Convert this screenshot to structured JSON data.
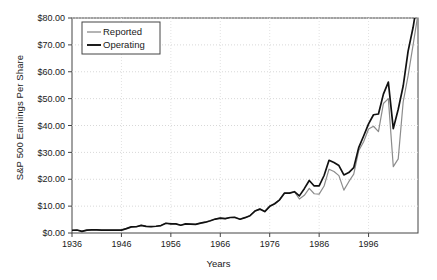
{
  "chart_data": {
    "type": "line",
    "title": "",
    "xlabel": "Years",
    "ylabel": "S&P 500 Earnings Per Share",
    "xlim": [
      1936,
      2006
    ],
    "ylim": [
      0,
      80
    ],
    "grid": true,
    "legend_position": "top-left",
    "y_tick_labels": [
      "$0.00",
      "$10.00",
      "$20.00",
      "$30.00",
      "$40.00",
      "$50.00",
      "$60.00",
      "$70.00",
      "$80.00"
    ],
    "y_tick_values": [
      0,
      10,
      20,
      30,
      40,
      50,
      60,
      70,
      80
    ],
    "x_tick_labels": [
      "1936",
      "1946",
      "1956",
      "1966",
      "1976",
      "1986",
      "1996"
    ],
    "x_tick_values": [
      1936,
      1946,
      1956,
      1966,
      1976,
      1986,
      1996
    ],
    "x": [
      1936,
      1937,
      1938,
      1939,
      1940,
      1941,
      1942,
      1943,
      1944,
      1945,
      1946,
      1947,
      1948,
      1949,
      1950,
      1951,
      1952,
      1953,
      1954,
      1955,
      1956,
      1957,
      1958,
      1959,
      1960,
      1961,
      1962,
      1963,
      1964,
      1965,
      1966,
      1967,
      1968,
      1969,
      1970,
      1971,
      1972,
      1973,
      1974,
      1975,
      1976,
      1977,
      1978,
      1979,
      1980,
      1981,
      1982,
      1983,
      1984,
      1985,
      1986,
      1987,
      1988,
      1989,
      1990,
      1991,
      1992,
      1993,
      1994,
      1995,
      1996,
      1997,
      1998,
      1999,
      2000,
      2001,
      2002,
      2003,
      2004,
      2005,
      2006
    ],
    "series": [
      {
        "name": "Reported",
        "color": "#8c8c8c",
        "values": [
          1.02,
          1.12,
          0.62,
          1.07,
          1.13,
          1.16,
          1.1,
          1.07,
          1.06,
          1.04,
          1.06,
          1.61,
          2.29,
          2.32,
          2.84,
          2.44,
          2.4,
          2.51,
          2.77,
          3.62,
          3.41,
          3.37,
          2.89,
          3.39,
          3.27,
          3.19,
          3.67,
          4.02,
          4.55,
          5.19,
          5.55,
          5.33,
          5.76,
          5.78,
          5.13,
          5.7,
          6.42,
          8.16,
          8.89,
          7.96,
          9.91,
          10.89,
          12.33,
          14.86,
          14.82,
          15.36,
          12.64,
          14.03,
          16.64,
          14.61,
          14.48,
          17.5,
          23.75,
          22.87,
          21.34,
          15.97,
          19.09,
          21.89,
          30.6,
          33.96,
          38.73,
          39.72,
          37.71,
          48.17,
          50.0,
          24.69,
          27.59,
          48.74,
          58.55,
          69.93,
          81.51
        ]
      },
      {
        "name": "Operating",
        "color": "#111111",
        "values": [
          1.02,
          1.12,
          0.62,
          1.07,
          1.13,
          1.16,
          1.1,
          1.07,
          1.06,
          1.04,
          1.06,
          1.61,
          2.29,
          2.32,
          2.84,
          2.44,
          2.4,
          2.51,
          2.77,
          3.62,
          3.41,
          3.37,
          2.89,
          3.39,
          3.27,
          3.19,
          3.67,
          4.02,
          4.55,
          5.19,
          5.55,
          5.33,
          5.76,
          5.78,
          5.13,
          5.7,
          6.42,
          8.16,
          8.89,
          7.96,
          9.91,
          10.89,
          12.33,
          14.86,
          14.82,
          15.36,
          13.82,
          16.5,
          19.55,
          17.5,
          17.5,
          21.4,
          27.05,
          26.2,
          25.1,
          21.6,
          22.5,
          24.3,
          31.75,
          36.1,
          40.63,
          44.01,
          44.27,
          51.68,
          56.13,
          38.85,
          46.04,
          54.69,
          67.68,
          76.45,
          87.72
        ]
      }
    ]
  },
  "legend": {
    "entries": [
      {
        "label": "Reported"
      },
      {
        "label": "Operating"
      }
    ]
  }
}
